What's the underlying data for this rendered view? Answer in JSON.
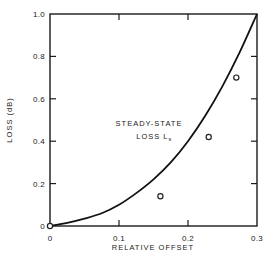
{
  "chart_data": {
    "type": "line",
    "title": "",
    "xlabel": "RELATIVE OFFSET",
    "ylabel": "LOSS (dB)",
    "xlim": [
      0,
      0.3
    ],
    "ylim": [
      0,
      1.0
    ],
    "grid": false,
    "legend": null,
    "x_ticks": [
      0,
      0.1,
      0.2,
      0.3
    ],
    "x_tick_labels": [
      "0",
      "0.1",
      "0.2",
      "0.3"
    ],
    "y_ticks": [
      0,
      0.2,
      0.4,
      0.6,
      0.8,
      1.0
    ],
    "y_tick_labels": [
      "0",
      "0.2",
      "0.4",
      "0.6",
      "0.8",
      "1.0"
    ],
    "series": [
      {
        "name": "Steady-state loss Ls",
        "style": "solid-line",
        "x": [
          0,
          0.025,
          0.05,
          0.075,
          0.1,
          0.125,
          0.15,
          0.175,
          0.2,
          0.225,
          0.25,
          0.275,
          0.3
        ],
        "y": [
          0,
          0.015,
          0.035,
          0.06,
          0.1,
          0.155,
          0.22,
          0.3,
          0.4,
          0.52,
          0.66,
          0.82,
          1.0
        ]
      },
      {
        "name": "Measured",
        "style": "open-circle-markers",
        "x": [
          0,
          0.16,
          0.23,
          0.27
        ],
        "y": [
          0,
          0.14,
          0.42,
          0.7
        ]
      }
    ],
    "annotations": [
      {
        "text": "STEADY-STATE",
        "x": 0.095,
        "y": 0.47
      },
      {
        "text": "LOSS L",
        "subscript": "s",
        "x": 0.125,
        "y": 0.41
      }
    ]
  }
}
